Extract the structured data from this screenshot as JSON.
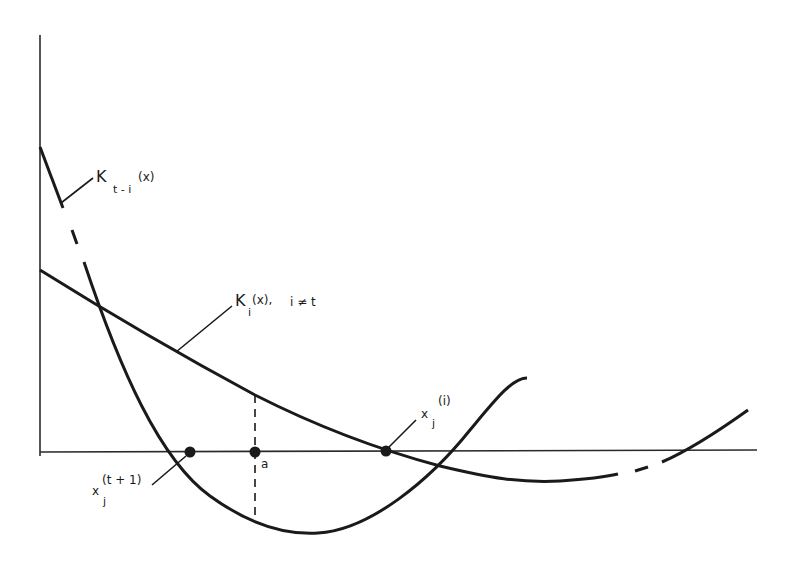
{
  "diagram": {
    "type": "function-curves",
    "axes": {
      "x_axis": "horizontal baseline",
      "y_axis": "vertical left"
    },
    "curves": [
      {
        "id": "K_t_i",
        "label_main": "K",
        "label_sub": "t - i",
        "label_arg": "(x)",
        "description": "steep parabola, partially dashed near top"
      },
      {
        "id": "K_i",
        "label_main": "K",
        "label_sub": "i",
        "label_arg": "(x),",
        "label_cond": "i ≠ t",
        "description": "shallow decreasing curve with minimum right of center, dashed segment at right"
      }
    ],
    "points": [
      {
        "id": "x_j_t1",
        "label_main": "x",
        "label_sub": "j",
        "label_sup": "(t + 1)"
      },
      {
        "id": "a",
        "label": "a"
      },
      {
        "id": "x_j_i",
        "label_main": "x",
        "label_sub": "j",
        "label_sup": "(i)"
      }
    ],
    "colors": {
      "ink": "#1a1a1a",
      "background": "#ffffff"
    }
  }
}
